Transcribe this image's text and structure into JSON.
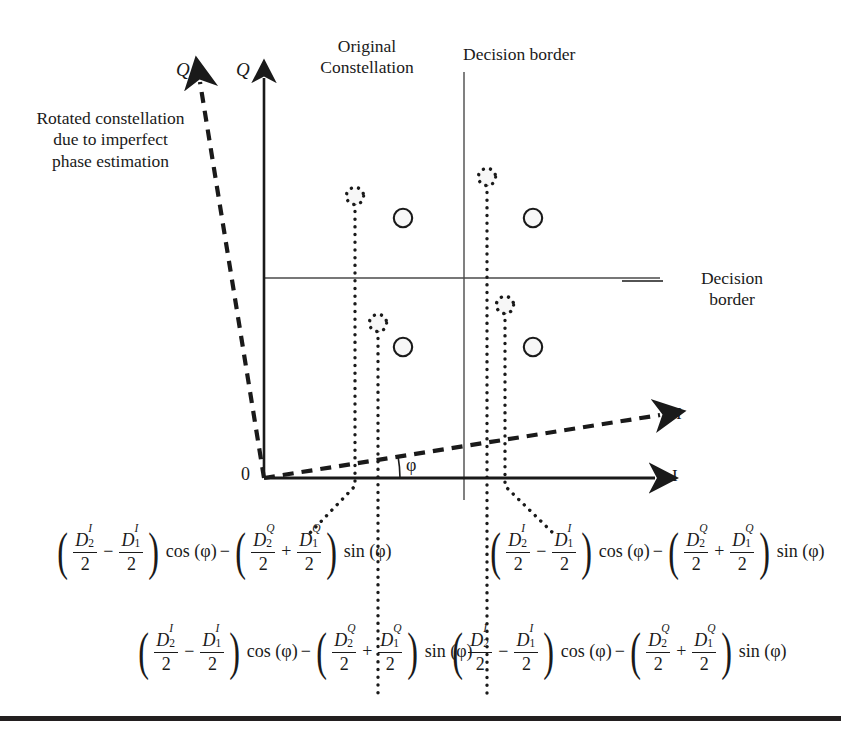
{
  "figure": {
    "type": "signal-constellation-diagram",
    "labels": {
      "rotated_note": "Rotated constellation\ndue to imperfect\nphase estimation",
      "original_note": "Original\nConstellation",
      "decision_border_top": "Decision border",
      "decision_border_right": "Decision\nborder",
      "axis_q_rotated": "Q",
      "axis_q_original": "Q",
      "axis_i_rotated": "I",
      "axis_i_original": "I",
      "origin": "0",
      "phase_angle": "φ"
    },
    "geometry": {
      "origin": {
        "x": 264,
        "y": 478
      },
      "q_axis_original": {
        "x": 264,
        "y_top": 68,
        "y_bottom": 478
      },
      "i_axis_original": {
        "y": 478,
        "x_left": 264,
        "x_right": 668
      },
      "q_axis_rotated": {
        "x1": 264,
        "y1": 478,
        "x2": 198,
        "y2": 70
      },
      "i_axis_rotated": {
        "x1": 264,
        "y1": 478,
        "x2": 672,
        "y2": 413
      },
      "decision_border_vertical": {
        "x": 464,
        "y_top": 72,
        "y_bottom": 500
      },
      "decision_border_horizontal": {
        "y": 278,
        "x_left": 264,
        "x_right": 660
      }
    },
    "original_points": [
      {
        "x": 403,
        "y": 218
      },
      {
        "x": 533,
        "y": 218
      },
      {
        "x": 403,
        "y": 347
      },
      {
        "x": 533,
        "y": 347
      }
    ],
    "rotated_points": [
      {
        "x": 355,
        "y": 196
      },
      {
        "x": 487,
        "y": 177
      },
      {
        "x": 378,
        "y": 323
      },
      {
        "x": 505,
        "y": 305
      }
    ],
    "leader_lines": [
      {
        "from_x": 355,
        "from_y": 196,
        "to_x": 355,
        "to_y": 486,
        "then_x": 310,
        "then_y": 533
      },
      {
        "from_x": 378,
        "from_y": 323,
        "to_x": 378,
        "to_y": 486,
        "then_x": 378,
        "then_y": 700
      },
      {
        "from_x": 487,
        "from_y": 177,
        "to_x": 487,
        "to_y": 486,
        "then_x": 487,
        "then_y": 700
      },
      {
        "from_x": 505,
        "from_y": 305,
        "to_x": 505,
        "to_y": 486,
        "then_x": 553,
        "then_y": 533
      }
    ]
  },
  "formulas": [
    {
      "id": "formula-top-left",
      "terms": {
        "n1": "D",
        "n1_sup": "I",
        "n1_sub": "2",
        "d1": "2",
        "op1": "−",
        "n2": "D",
        "n2_sup": "I",
        "n2_sub": "1",
        "d2": "2",
        "trig1": "cos (φ)",
        "op2": "−",
        "n3": "D",
        "n3_sup": "Q",
        "n3_sub": "2",
        "d3": "2",
        "op3": "+",
        "n4": "D",
        "n4_sup": "Q",
        "n4_sub": "1",
        "d4": "2",
        "trig2": "sin (φ)"
      }
    },
    {
      "id": "formula-top-right",
      "terms": {
        "n1": "D",
        "n1_sup": "I",
        "n1_sub": "2",
        "d1": "2",
        "op1": "−",
        "n2": "D",
        "n2_sup": "I",
        "n2_sub": "1",
        "d2": "2",
        "trig1": "cos (φ)",
        "op2": "−",
        "n3": "D",
        "n3_sup": "Q",
        "n3_sub": "2",
        "d3": "2",
        "op3": "+",
        "n4": "D",
        "n4_sup": "Q",
        "n4_sub": "1",
        "d4": "2",
        "trig2": "sin (φ)"
      }
    },
    {
      "id": "formula-bottom-left",
      "terms": {
        "n1": "D",
        "n1_sup": "I",
        "n1_sub": "2",
        "d1": "2",
        "op1": "−",
        "n2": "D",
        "n2_sup": "I",
        "n2_sub": "1",
        "d2": "2",
        "trig1": "cos (φ)",
        "op2": "−",
        "n3": "D",
        "n3_sup": "Q",
        "n3_sub": "2",
        "d3": "2",
        "op3": "+",
        "n4": "D",
        "n4_sup": "Q",
        "n4_sub": "1",
        "d4": "2",
        "trig2": "sin (φ)"
      }
    },
    {
      "id": "formula-bottom-right",
      "terms": {
        "n1": "D",
        "n1_sup": "I",
        "n1_sub": "2",
        "d1": "2",
        "op1": "−",
        "n2": "D",
        "n2_sup": "I",
        "n2_sub": "1",
        "d2": "2",
        "trig1": "cos (φ)",
        "op2": "−",
        "n3": "D",
        "n3_sup": "Q",
        "n3_sub": "2",
        "d3": "2",
        "op3": "+",
        "n4": "D",
        "n4_sup": "Q",
        "n4_sub": "1",
        "d4": "2",
        "trig2": "sin (φ)"
      }
    }
  ],
  "colors": {
    "ink": "#1a1a1a",
    "rule": "#231f20",
    "thin_line": "#4a4a4a"
  }
}
